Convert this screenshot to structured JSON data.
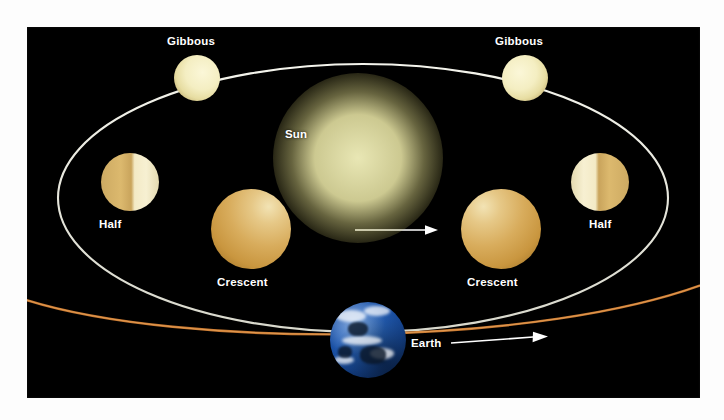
{
  "figure": {
    "background_color": "#ffffff",
    "panel_color": "#000000"
  },
  "bodies": {
    "sun": {
      "label": "Sun",
      "color": "#f2efbe",
      "glow_color": "#e4de8c"
    },
    "earth": {
      "label": "Earth",
      "color": "#235fb8"
    },
    "planets": [
      {
        "label": "Gibbous",
        "phase": "gibbous",
        "position": "upper-left",
        "lit_side": "right"
      },
      {
        "label": "Gibbous",
        "phase": "gibbous",
        "position": "upper-right",
        "lit_side": "left"
      },
      {
        "label": "Half",
        "phase": "half",
        "position": "left",
        "lit_side": "right"
      },
      {
        "label": "Half",
        "phase": "half",
        "position": "right",
        "lit_side": "left"
      },
      {
        "label": "Crescent",
        "phase": "crescent",
        "position": "lower-left",
        "lit_side": "upper-right"
      },
      {
        "label": "Crescent",
        "phase": "crescent",
        "position": "lower-right",
        "lit_side": "upper-left"
      }
    ]
  },
  "orbits": {
    "planet_orbit": {
      "name": "planet-orbit-ellipse",
      "color": "#e8e8e0",
      "direction": "counterclockwise"
    },
    "earth_orbit": {
      "name": "earth-orbit-line",
      "color": "#c87830",
      "direction": "rightward"
    }
  },
  "arrows": {
    "planet_orbit_arrow": {
      "name": "planet-orbit-direction-arrow",
      "color": "#ffffff",
      "direction": "right"
    },
    "earth_orbit_arrow": {
      "name": "earth-orbit-direction-arrow",
      "color": "#ffffff",
      "direction": "right"
    }
  }
}
